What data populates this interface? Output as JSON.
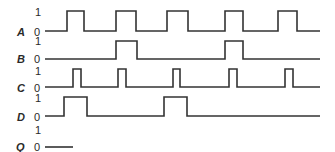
{
  "diagram": {
    "type": "timing-diagram",
    "level_labels": {
      "high": "1",
      "low": "0"
    },
    "signals": [
      {
        "name": "A",
        "x_start": 45,
        "x_end": 320,
        "high_intervals": [
          [
            67,
            84
          ],
          [
            116,
            136
          ],
          [
            167,
            188
          ],
          [
            225,
            243
          ],
          [
            278,
            297
          ]
        ]
      },
      {
        "name": "B",
        "x_start": 45,
        "x_end": 320,
        "high_intervals": [
          [
            116,
            137
          ],
          [
            225,
            243
          ]
        ]
      },
      {
        "name": "C",
        "x_start": 45,
        "x_end": 320,
        "high_intervals": [
          [
            73,
            81
          ],
          [
            118,
            126
          ],
          [
            173,
            180
          ],
          [
            229,
            237
          ],
          [
            285,
            293
          ]
        ]
      },
      {
        "name": "D",
        "x_start": 45,
        "x_end": 320,
        "high_intervals": [
          [
            64,
            87
          ],
          [
            164,
            187
          ]
        ]
      },
      {
        "name": "Q",
        "x_start": 45,
        "x_end": 73,
        "high_intervals": []
      }
    ]
  }
}
